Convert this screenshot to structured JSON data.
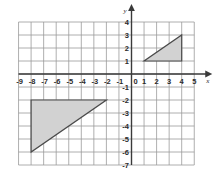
{
  "figure": {
    "kind": "cartesian-coordinate-plane",
    "background_color": "#ffffff",
    "grid_color": "#9a9a9a",
    "axis_color": "#3a3a3a",
    "shape_fill_color": "#d2d2d2",
    "shape_stroke_color": "#4a4a4a"
  },
  "axes": {
    "x_axis_label": "x",
    "y_axis_label": "y",
    "origin_label": "0",
    "x_tick_labels": [
      "-9",
      "-8",
      "-7",
      "-6",
      "-5",
      "-4",
      "-3",
      "-2",
      "-1",
      "1",
      "2",
      "3",
      "4",
      "5"
    ],
    "y_tick_labels": [
      "4",
      "3",
      "2",
      "1",
      "-1",
      "-2",
      "-3",
      "-4",
      "-5",
      "-6",
      "-7"
    ],
    "x_min": -9,
    "x_max": 5,
    "y_min": -7,
    "y_max": 4,
    "grid": true
  },
  "chart_data": {
    "type": "scatter",
    "title": "",
    "xlabel": "x",
    "ylabel": "y",
    "xlim": [
      -9,
      5
    ],
    "ylim": [
      -7,
      4
    ],
    "grid": true,
    "x": [],
    "values": [],
    "categories": [],
    "x_ticks": [
      -9,
      -8,
      -7,
      -6,
      -5,
      -4,
      -3,
      -2,
      -1,
      0,
      1,
      2,
      3,
      4,
      5
    ],
    "y_ticks": [
      4,
      3,
      2,
      1,
      0,
      -1,
      -2,
      -3,
      -4,
      -5,
      -6,
      -7
    ],
    "annotations": [
      {
        "name": "small-triangle",
        "shape": "right-triangle",
        "fill": "#d2d2d2",
        "vertices": [
          [
            1,
            1
          ],
          [
            4,
            1
          ],
          [
            4,
            3
          ]
        ],
        "legs": {
          "horizontal": 3,
          "vertical": 2
        }
      },
      {
        "name": "large-triangle",
        "shape": "right-triangle",
        "fill": "#d2d2d2",
        "vertices": [
          [
            -8,
            -2
          ],
          [
            -2,
            -2
          ],
          [
            -8,
            -6
          ]
        ],
        "legs": {
          "horizontal": 6,
          "vertical": 4
        }
      }
    ]
  }
}
